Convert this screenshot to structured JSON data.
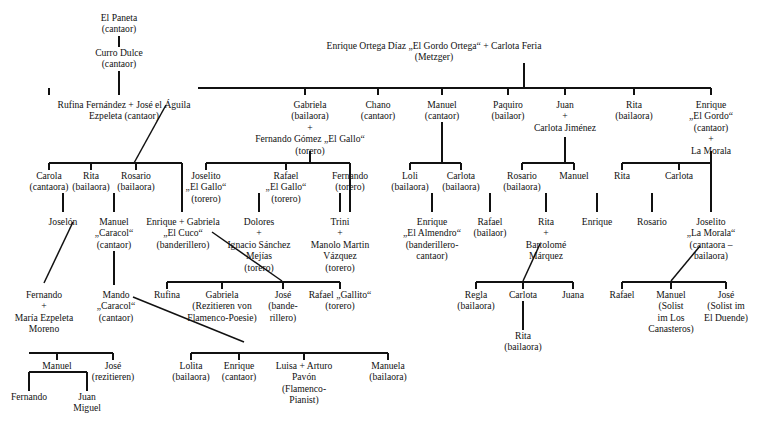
{
  "diagram": {
    "line_color": "#111111",
    "text_color": "#111111",
    "background": "#ffffff"
  },
  "nodes": [
    {
      "id": "el-paneta",
      "x": 119,
      "y": 12,
      "lines": [
        "El Paneta",
        "(cantaor)"
      ]
    },
    {
      "id": "curro-dulce",
      "x": 119,
      "y": 47,
      "lines": [
        "Curro Dulce",
        "(cantaor)"
      ]
    },
    {
      "id": "rufina-jose",
      "x": 124,
      "y": 99,
      "lines": [
        "Rufina Fernández  +  José el Águila",
        "Ezpeleta                 (cantaor)"
      ]
    },
    {
      "id": "enrique-ortega",
      "x": 434,
      "y": 40,
      "lines": [
        "Enrique Ortega Díaz „El Gordo Ortega“ + Carlota Feria",
        "(Metzger)"
      ]
    },
    {
      "id": "carola",
      "x": 49,
      "y": 170,
      "lines": [
        "Carola",
        "(cantaora)"
      ]
    },
    {
      "id": "rita-b1",
      "x": 91,
      "y": 170,
      "lines": [
        "Rita",
        "(bailaora)"
      ]
    },
    {
      "id": "rosario-b1",
      "x": 136,
      "y": 170,
      "lines": [
        "Rosario",
        "(bailaora)"
      ]
    },
    {
      "id": "gabriela-gallo",
      "x": 310,
      "y": 99,
      "lines": [
        "Gabriela",
        "(bailaora)",
        "+",
        "Fernando Gómez „El Gallo“",
        "(torero)"
      ]
    },
    {
      "id": "chano",
      "x": 378,
      "y": 99,
      "lines": [
        "Chano",
        "(cantaor)"
      ]
    },
    {
      "id": "manuel-c",
      "x": 442,
      "y": 99,
      "lines": [
        "Manuel",
        "(cantaor)"
      ]
    },
    {
      "id": "paquiro",
      "x": 508,
      "y": 99,
      "lines": [
        "Paquiro",
        "(bailaor)"
      ]
    },
    {
      "id": "juan-carlota",
      "x": 565,
      "y": 99,
      "lines": [
        "Juan",
        "+",
        "Carlota Jiménez"
      ]
    },
    {
      "id": "rita-b2",
      "x": 634,
      "y": 99,
      "lines": [
        "Rita",
        "(bailaora)"
      ]
    },
    {
      "id": "enrique-gordo",
      "x": 711,
      "y": 99,
      "lines": [
        "Enrique",
        "„El Gordo“",
        "(cantaor)",
        "+",
        "La Morala"
      ]
    },
    {
      "id": "joselito-gallo",
      "x": 206,
      "y": 170,
      "lines": [
        "Joselito",
        "„El Gallo“",
        "(torero)"
      ]
    },
    {
      "id": "rafael-gallo",
      "x": 286,
      "y": 170,
      "lines": [
        "Rafael",
        "„El Gallo“",
        "(torero)"
      ]
    },
    {
      "id": "fernando-torero",
      "x": 350,
      "y": 170,
      "lines": [
        "Fernando",
        "(torero)"
      ]
    },
    {
      "id": "loli",
      "x": 410,
      "y": 170,
      "lines": [
        "Loli",
        "(bailaora)"
      ]
    },
    {
      "id": "carlota-b1",
      "x": 461,
      "y": 170,
      "lines": [
        "Carlota",
        "(bailaora)"
      ]
    },
    {
      "id": "rosario-b2",
      "x": 522,
      "y": 170,
      "lines": [
        "Rosario",
        "(bailaora)"
      ]
    },
    {
      "id": "manuel-2",
      "x": 574,
      "y": 170,
      "lines": [
        "Manuel"
      ]
    },
    {
      "id": "rita-3",
      "x": 622,
      "y": 170,
      "lines": [
        "Rita"
      ]
    },
    {
      "id": "carlota-3",
      "x": 679,
      "y": 170,
      "lines": [
        "Carlota"
      ]
    },
    {
      "id": "joselon",
      "x": 63,
      "y": 216,
      "lines": [
        "Joselón"
      ]
    },
    {
      "id": "manuel-caracol",
      "x": 114,
      "y": 216,
      "lines": [
        "Manuel",
        "„Caracol“",
        "(cantaor)"
      ]
    },
    {
      "id": "enrique-cuco-gab",
      "x": 183,
      "y": 216,
      "lines": [
        "Enrique + Gabriela",
        "„El Cuco“",
        "(banderillero)"
      ]
    },
    {
      "id": "dolores-ignacio",
      "x": 259,
      "y": 216,
      "lines": [
        "Dolores",
        "+",
        "Ignacio Sánchez",
        "Mejías",
        "(torero)"
      ]
    },
    {
      "id": "trini-manolo",
      "x": 340,
      "y": 216,
      "lines": [
        "Trini",
        "+",
        "Manolo Martin",
        "Vázquez",
        "(torero)"
      ]
    },
    {
      "id": "enrique-almendro",
      "x": 432,
      "y": 216,
      "lines": [
        "Enrique",
        "„El Almendro“",
        "(banderillero-",
        "cantaor)"
      ]
    },
    {
      "id": "rafael-bailaor",
      "x": 490,
      "y": 216,
      "lines": [
        "Rafael",
        "(bailaor)"
      ]
    },
    {
      "id": "rita-bartolome",
      "x": 546,
      "y": 216,
      "lines": [
        "Rita",
        "+",
        "Bartolomé",
        "Márquez"
      ]
    },
    {
      "id": "enrique-4",
      "x": 597,
      "y": 216,
      "lines": [
        "Enrique"
      ]
    },
    {
      "id": "rosario-3",
      "x": 652,
      "y": 216,
      "lines": [
        "Rosario"
      ]
    },
    {
      "id": "joselito-morala",
      "x": 711,
      "y": 216,
      "lines": [
        "Joselito",
        "„La Morala“",
        "(cantaora –",
        "bailaora)"
      ]
    },
    {
      "id": "fernando-maria",
      "x": 44,
      "y": 289,
      "lines": [
        "Fernando",
        "+",
        "María Ezpeleta",
        "Moreno"
      ]
    },
    {
      "id": "mando-caracol",
      "x": 116,
      "y": 289,
      "lines": [
        "Mando",
        "„Caracol“",
        "(cantaor)"
      ]
    },
    {
      "id": "rufina-2",
      "x": 167,
      "y": 289,
      "lines": [
        "Rufina"
      ]
    },
    {
      "id": "gabriela-rez",
      "x": 222,
      "y": 289,
      "lines": [
        "Gabriela",
        "(Rezitieren von",
        "Flamenco-Poesie)"
      ]
    },
    {
      "id": "jose-bande",
      "x": 283,
      "y": 289,
      "lines": [
        "José",
        "(bande-",
        "rillero)"
      ]
    },
    {
      "id": "rafael-gallito",
      "x": 340,
      "y": 289,
      "lines": [
        "Rafael „Gallito“",
        "(torero)"
      ]
    },
    {
      "id": "regla",
      "x": 476,
      "y": 289,
      "lines": [
        "Regla",
        "(bailaora)"
      ]
    },
    {
      "id": "carlota-4",
      "x": 523,
      "y": 289,
      "lines": [
        "Carlota"
      ]
    },
    {
      "id": "juana",
      "x": 573,
      "y": 289,
      "lines": [
        "Juana"
      ]
    },
    {
      "id": "rafael-6",
      "x": 622,
      "y": 289,
      "lines": [
        "Rafael"
      ]
    },
    {
      "id": "manuel-solist",
      "x": 671,
      "y": 289,
      "lines": [
        "Manuel",
        "(Solist",
        "im Los",
        "Canasteros)"
      ]
    },
    {
      "id": "jose-duende",
      "x": 726,
      "y": 289,
      "lines": [
        "José",
        "(Solist im",
        "El Duende)"
      ]
    },
    {
      "id": "rita-bailaora-5",
      "x": 523,
      "y": 330,
      "lines": [
        "Rita",
        "(bailaora)"
      ]
    },
    {
      "id": "manuel-3",
      "x": 57,
      "y": 360,
      "lines": [
        "Manuel"
      ]
    },
    {
      "id": "jose-rez",
      "x": 113,
      "y": 360,
      "lines": [
        "José",
        "(rezitieren)"
      ]
    },
    {
      "id": "lolita",
      "x": 191,
      "y": 360,
      "lines": [
        "Lolita",
        "(bailaora)"
      ]
    },
    {
      "id": "enrique-cantaor2",
      "x": 239,
      "y": 360,
      "lines": [
        "Enrique",
        "(cantaor)"
      ]
    },
    {
      "id": "luisa-arturo",
      "x": 304,
      "y": 360,
      "lines": [
        "Luisa + Arturo",
        "Pavón",
        "(Flamenco-",
        "Pianist)"
      ]
    },
    {
      "id": "manuela",
      "x": 388,
      "y": 360,
      "lines": [
        "Manuela",
        "(bailaora)"
      ]
    },
    {
      "id": "fernando-3",
      "x": 29,
      "y": 391,
      "lines": [
        "Fernando"
      ]
    },
    {
      "id": "juan-miguel",
      "x": 87,
      "y": 391,
      "lines": [
        "Juan",
        "Miguel"
      ]
    }
  ],
  "edges": {
    "verticals": [
      {
        "name": "paneta-to-curro",
        "x": 119,
        "y1": 36,
        "y2": 47
      },
      {
        "name": "curro-to-rufina",
        "x": 119,
        "y1": 71,
        "y2": 95
      },
      {
        "name": "ortega-drop",
        "x": 524,
        "y1": 63,
        "y2": 88
      },
      {
        "name": "carola-tick",
        "x": 49,
        "y1": 88,
        "y2": 95
      },
      {
        "name": "gabriela-tick",
        "x": 305,
        "y1": 88,
        "y2": 95
      },
      {
        "name": "chano-tick",
        "x": 378,
        "y1": 88,
        "y2": 95
      },
      {
        "name": "manuel-tick",
        "x": 442,
        "y1": 88,
        "y2": 95
      },
      {
        "name": "paquiro-tick",
        "x": 508,
        "y1": 88,
        "y2": 95
      },
      {
        "name": "juan-tick",
        "x": 565,
        "y1": 88,
        "y2": 95
      },
      {
        "name": "rita-tick",
        "x": 634,
        "y1": 88,
        "y2": 95
      },
      {
        "name": "enrique-tick",
        "x": 711,
        "y1": 88,
        "y2": 95
      },
      {
        "name": "gallo-drop",
        "x": 310,
        "y1": 151,
        "y2": 163
      },
      {
        "name": "juan-drop",
        "x": 565,
        "y1": 137,
        "y2": 163
      },
      {
        "name": "gordo-drop",
        "x": 711,
        "y1": 151,
        "y2": 163
      },
      {
        "name": "manuel-c-drop",
        "x": 442,
        "y1": 122,
        "y2": 163
      },
      {
        "name": "carola-v",
        "x": 49,
        "y1": 163,
        "y2": 170
      },
      {
        "name": "rita1-v",
        "x": 91,
        "y1": 163,
        "y2": 170
      },
      {
        "name": "rosario1-v",
        "x": 136,
        "y1": 163,
        "y2": 170
      },
      {
        "name": "enrique-cuco-v",
        "x": 182,
        "y1": 163,
        "y2": 212
      },
      {
        "name": "joselito-v",
        "x": 206,
        "y1": 163,
        "y2": 170
      },
      {
        "name": "rafael-v",
        "x": 286,
        "y1": 163,
        "y2": 170
      },
      {
        "name": "fernando-v",
        "x": 350,
        "y1": 163,
        "y2": 212
      },
      {
        "name": "loli-v",
        "x": 410,
        "y1": 163,
        "y2": 170
      },
      {
        "name": "carlota-v",
        "x": 461,
        "y1": 163,
        "y2": 170
      },
      {
        "name": "rosario2-v",
        "x": 522,
        "y1": 163,
        "y2": 170
      },
      {
        "name": "manuel2-v",
        "x": 574,
        "y1": 163,
        "y2": 170
      },
      {
        "name": "rita3-v",
        "x": 622,
        "y1": 163,
        "y2": 170
      },
      {
        "name": "carlota3-v",
        "x": 679,
        "y1": 163,
        "y2": 170
      },
      {
        "name": "joselito-morala-v",
        "x": 711,
        "y1": 163,
        "y2": 212
      },
      {
        "name": "joselon-v",
        "x": 63,
        "y1": 193,
        "y2": 212
      },
      {
        "name": "manuel-caracol-v",
        "x": 114,
        "y1": 193,
        "y2": 212
      },
      {
        "name": "dolores-v",
        "x": 259,
        "y1": 193,
        "y2": 212
      },
      {
        "name": "trini-v",
        "x": 340,
        "y1": 193,
        "y2": 212
      },
      {
        "name": "almendro-v",
        "x": 432,
        "y1": 193,
        "y2": 212
      },
      {
        "name": "rafael-bailaor-v",
        "x": 490,
        "y1": 193,
        "y2": 212
      },
      {
        "name": "rita-barto-v",
        "x": 546,
        "y1": 193,
        "y2": 212
      },
      {
        "name": "enrique4-v",
        "x": 597,
        "y1": 193,
        "y2": 212
      },
      {
        "name": "rosario3-v",
        "x": 652,
        "y1": 193,
        "y2": 212
      },
      {
        "name": "caracol-down",
        "x": 114,
        "y1": 251,
        "y2": 285
      },
      {
        "name": "rufina2-v",
        "x": 167,
        "y1": 282,
        "y2": 289
      },
      {
        "name": "gabriela-rez-v",
        "x": 222,
        "y1": 282,
        "y2": 289
      },
      {
        "name": "jose-bande-v",
        "x": 283,
        "y1": 282,
        "y2": 289
      },
      {
        "name": "rafael-gallito-v",
        "x": 340,
        "y1": 282,
        "y2": 289
      },
      {
        "name": "regla-v",
        "x": 476,
        "y1": 282,
        "y2": 289
      },
      {
        "name": "carlota4-v",
        "x": 523,
        "y1": 282,
        "y2": 289
      },
      {
        "name": "juana-v",
        "x": 573,
        "y1": 282,
        "y2": 289
      },
      {
        "name": "rafael6-v",
        "x": 622,
        "y1": 282,
        "y2": 289
      },
      {
        "name": "manuel-solist-v",
        "x": 671,
        "y1": 282,
        "y2": 289
      },
      {
        "name": "jose-duende-v",
        "x": 726,
        "y1": 282,
        "y2": 289
      },
      {
        "name": "carlota-to-rita",
        "x": 523,
        "y1": 301,
        "y2": 330
      },
      {
        "name": "manuel3-v",
        "x": 57,
        "y1": 353,
        "y2": 360
      },
      {
        "name": "jose-rez-v",
        "x": 113,
        "y1": 353,
        "y2": 360
      },
      {
        "name": "lolita-v",
        "x": 191,
        "y1": 353,
        "y2": 360
      },
      {
        "name": "enrique-c2-v",
        "x": 239,
        "y1": 353,
        "y2": 360
      },
      {
        "name": "luisa-v",
        "x": 304,
        "y1": 353,
        "y2": 360
      },
      {
        "name": "manuela-v",
        "x": 388,
        "y1": 353,
        "y2": 360
      },
      {
        "name": "fernando3-v",
        "x": 29,
        "y1": 372,
        "y2": 391
      },
      {
        "name": "juanmiguel-v",
        "x": 87,
        "y1": 372,
        "y2": 391
      }
    ],
    "horizontals": [
      {
        "name": "ortega-sibling-bar",
        "x1": 198,
        "x2": 711,
        "y": 88
      },
      {
        "name": "aguila-children-bar",
        "x1": 49,
        "x2": 182,
        "y": 163
      },
      {
        "name": "gallo-children-bar",
        "x1": 206,
        "x2": 350,
        "y": 163
      },
      {
        "name": "manuel-children-bar",
        "x1": 410,
        "x2": 461,
        "y": 163
      },
      {
        "name": "juan-children-bar",
        "x1": 522,
        "x2": 574,
        "y": 163
      },
      {
        "name": "gordo-children-bar",
        "x1": 622,
        "x2": 711,
        "y": 163
      },
      {
        "name": "cuco-children-bar",
        "x1": 167,
        "x2": 283,
        "y": 282
      },
      {
        "name": "dolores-trini-bar",
        "x1": 222,
        "x2": 340,
        "y": 282
      },
      {
        "name": "rita-barto-bar",
        "x1": 476,
        "x2": 573,
        "y": 282
      },
      {
        "name": "morala-bar",
        "x1": 622,
        "x2": 726,
        "y": 282
      },
      {
        "name": "fernando-kids-bar",
        "x1": 29,
        "x2": 113,
        "y": 353
      },
      {
        "name": "gabriela-kids-bar",
        "x1": 191,
        "x2": 388,
        "y": 353
      },
      {
        "name": "manuel3-kids-bar",
        "x1": 29,
        "x2": 87,
        "y": 372
      }
    ],
    "diagonals": [
      {
        "name": "jose-aguila-to-children",
        "x1": 166,
        "y1": 105,
        "x2": 134,
        "y2": 163
      },
      {
        "name": "joselon-to-fernando",
        "x1": 73,
        "y1": 222,
        "x2": 44,
        "y2": 283
      },
      {
        "name": "gabriela-cuco-to-kids",
        "x1": 212,
        "y1": 232,
        "x2": 282,
        "y2": 281
      },
      {
        "name": "caracol-to-bar",
        "x1": 133,
        "y1": 297,
        "x2": 244,
        "y2": 342
      },
      {
        "name": "barto-to-kids",
        "x1": 540,
        "y1": 244,
        "x2": 523,
        "y2": 281
      },
      {
        "name": "morala-to-kids",
        "x1": 700,
        "y1": 246,
        "x2": 671,
        "y2": 281
      }
    ]
  }
}
